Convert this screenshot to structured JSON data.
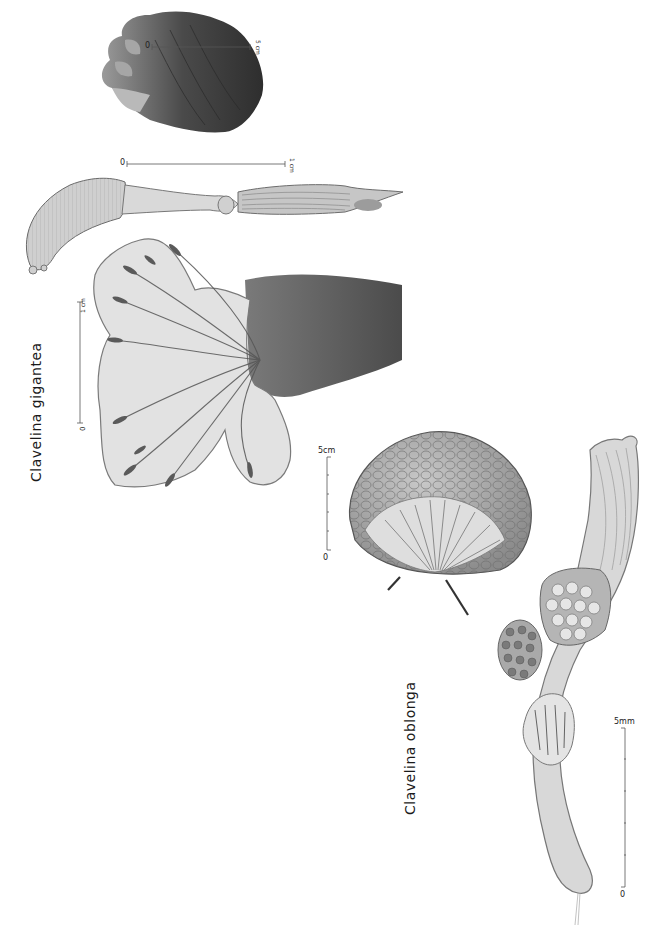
{
  "plate": {
    "background": "#ffffff",
    "ink_color": "#1a1a1a"
  },
  "species": [
    {
      "name": "Clavelina gigantea",
      "label_orientation": "vertical",
      "figures": [
        {
          "id": "colony-whole",
          "description": "whole colony, dark lobed mass",
          "scale": {
            "start": "0",
            "end": "5 cm"
          }
        },
        {
          "id": "zooid-elongate",
          "description": "single elongate zooid",
          "scale": {
            "start": "0",
            "end": "1 cm"
          }
        },
        {
          "id": "colony-head",
          "description": "colony head with branching lobes",
          "scale": {
            "start": "0",
            "end": "1 cm"
          }
        }
      ]
    },
    {
      "name": "Clavelina oblonga",
      "label_orientation": "vertical",
      "figures": [
        {
          "id": "colony-dome",
          "description": "dome-shaped colony",
          "scale": {
            "start": "0",
            "end": "5cm",
            "ticks": 5
          }
        },
        {
          "id": "zooid-single",
          "description": "single zooid with gonads",
          "scale": {
            "start": "0",
            "end": "5mm",
            "ticks": 5
          }
        }
      ]
    }
  ]
}
